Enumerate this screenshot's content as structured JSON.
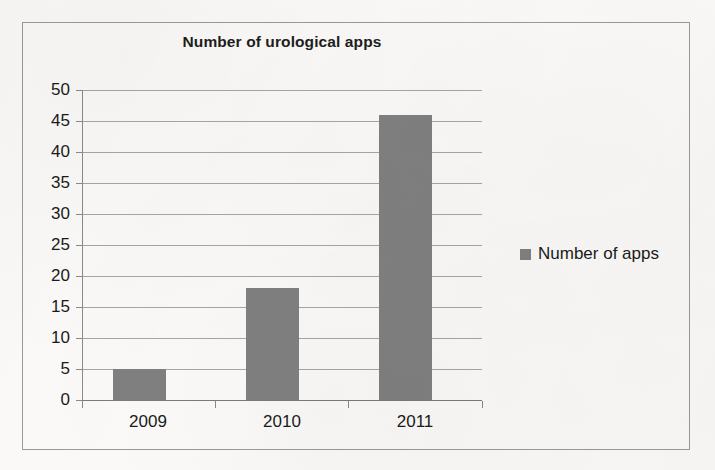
{
  "chart_data": {
    "type": "bar",
    "title": "Number of urological apps",
    "categories": [
      "2009",
      "2010",
      "2011"
    ],
    "values": [
      5,
      18,
      46
    ],
    "series": [
      {
        "name": "Number of apps",
        "values": [
          5,
          18,
          46
        ]
      }
    ],
    "xlabel": "",
    "ylabel": "",
    "ylim": [
      0,
      50
    ],
    "ytick_step": 5,
    "yticks": [
      "50",
      "45",
      "40",
      "35",
      "30",
      "25",
      "20",
      "15",
      "10",
      "5",
      "0"
    ],
    "grid": true,
    "legend_position": "right",
    "bar_color": "#808080",
    "gridline_color": "#8e8e8e",
    "text_color": "#1a1a1a",
    "frame_color": "#9a9a9a",
    "background_color": "#fbfaf8"
  },
  "legend": {
    "entries": [
      {
        "label": "Number of apps",
        "color": "#808080",
        "marker": "square-marker"
      }
    ]
  }
}
